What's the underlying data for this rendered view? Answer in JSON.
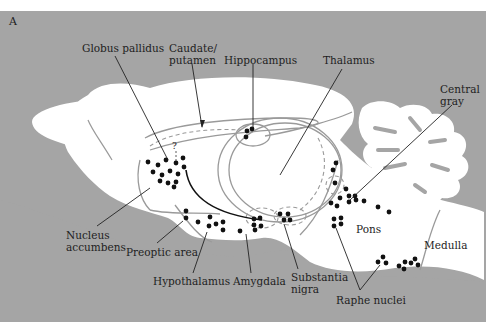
{
  "figure": {
    "panel_letter": "A",
    "colors": {
      "background": "#a5a5a5",
      "brain_fill": "#ffffff",
      "outline": "#9a9a9a",
      "dots": "#111111",
      "leader": "#222222"
    }
  },
  "labels": {
    "globus_pallidus": "Globus pallidus",
    "caudate_putamen": "Caudate/\nputamen",
    "hippocampus": "Hippocampus",
    "thalamus": "Thalamus",
    "central_gray": "Central\ngray",
    "nucleus_accumbens": "Nucleus\naccumbens",
    "preoptic_area": "Preoptic area",
    "hypothalamus": "Hypothalamus",
    "amygdala": "Amygdala",
    "substantia_nigra": "Substantia\nnigra",
    "pons": "Pons",
    "medulla": "Medulla",
    "raphe_nuclei": "Raphe nuclei",
    "question_mark": "?"
  }
}
